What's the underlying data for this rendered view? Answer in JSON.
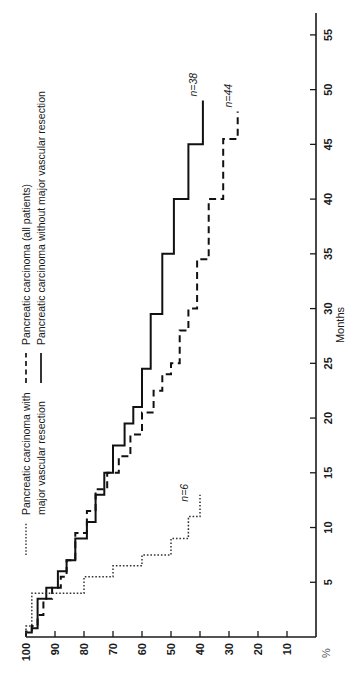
{
  "chart_data": {
    "type": "line",
    "title": "",
    "subtitle": "",
    "xlabel": "Months",
    "ylabel": "%",
    "xlim": [
      0,
      57
    ],
    "ylim": [
      0,
      100
    ],
    "xticks": [
      5,
      10,
      15,
      20,
      25,
      30,
      35,
      40,
      45,
      50,
      55
    ],
    "xticklabels": [
      "5",
      "10",
      "15",
      "20",
      "25",
      "30",
      "35",
      "40",
      "45",
      "50",
      "55"
    ],
    "yticks": [
      10,
      20,
      30,
      40,
      50,
      60,
      70,
      80,
      90,
      100
    ],
    "yticklabels": [
      "10",
      "20",
      "30",
      "40",
      "50",
      "60",
      "70",
      "80",
      "90",
      "100"
    ],
    "y_axis_unit_mark": "%",
    "grid": false,
    "orientation": "rotated-90-ccw",
    "legend_position": "top-left",
    "series": [
      {
        "name": "Pancreatic carcinoma (all patients)",
        "style": "dashed",
        "n_label": "n=44",
        "points": [
          [
            0,
            100
          ],
          [
            0.5,
            100
          ],
          [
            0.5,
            98
          ],
          [
            1.0,
            98
          ],
          [
            1.0,
            96
          ],
          [
            2.0,
            96
          ],
          [
            2.0,
            94
          ],
          [
            3.5,
            94
          ],
          [
            3.5,
            91
          ],
          [
            4.5,
            91
          ],
          [
            4.5,
            88
          ],
          [
            5.5,
            88
          ],
          [
            5.5,
            86
          ],
          [
            7.0,
            86
          ],
          [
            7.0,
            83
          ],
          [
            9.5,
            83
          ],
          [
            9.5,
            79
          ],
          [
            11.5,
            79
          ],
          [
            11.5,
            76
          ],
          [
            13.5,
            76
          ],
          [
            13.5,
            72
          ],
          [
            15.0,
            72
          ],
          [
            15.0,
            68
          ],
          [
            16.5,
            68
          ],
          [
            16.5,
            64
          ],
          [
            18.5,
            64
          ],
          [
            18.5,
            60
          ],
          [
            20.5,
            60
          ],
          [
            20.5,
            56
          ],
          [
            22.5,
            56
          ],
          [
            22.5,
            53
          ],
          [
            24.0,
            53
          ],
          [
            24.0,
            50
          ],
          [
            25.0,
            50
          ],
          [
            25.0,
            47
          ],
          [
            28.0,
            47
          ],
          [
            28.0,
            44
          ],
          [
            30.0,
            44
          ],
          [
            30.0,
            41
          ],
          [
            34.5,
            41
          ],
          [
            34.5,
            37
          ],
          [
            40.0,
            37
          ],
          [
            40.0,
            32
          ],
          [
            45.5,
            32
          ],
          [
            45.5,
            27
          ],
          [
            48.0,
            27
          ]
        ]
      },
      {
        "name": "Pancreatic carcinoma without major vascular resection",
        "style": "solid",
        "n_label": "n=38",
        "points": [
          [
            0,
            100
          ],
          [
            0.4,
            100
          ],
          [
            0.4,
            98
          ],
          [
            0.8,
            98
          ],
          [
            0.8,
            96
          ],
          [
            3.5,
            96
          ],
          [
            3.5,
            93
          ],
          [
            4.5,
            93
          ],
          [
            4.5,
            89
          ],
          [
            6.0,
            89
          ],
          [
            6.0,
            86
          ],
          [
            7.0,
            86
          ],
          [
            7.0,
            83
          ],
          [
            9.0,
            83
          ],
          [
            9.0,
            79
          ],
          [
            10.5,
            79
          ],
          [
            10.5,
            76
          ],
          [
            13.0,
            76
          ],
          [
            13.0,
            73
          ],
          [
            15.0,
            73
          ],
          [
            15.0,
            70
          ],
          [
            17.5,
            70
          ],
          [
            17.5,
            66
          ],
          [
            19.5,
            66
          ],
          [
            19.5,
            63
          ],
          [
            21.0,
            63
          ],
          [
            21.0,
            60
          ],
          [
            24.5,
            60
          ],
          [
            24.5,
            57
          ],
          [
            29.5,
            57
          ],
          [
            29.5,
            53
          ],
          [
            35.0,
            53
          ],
          [
            35.0,
            49
          ],
          [
            40.0,
            49
          ],
          [
            40.0,
            44
          ],
          [
            45.0,
            44
          ],
          [
            45.0,
            39
          ],
          [
            49.0,
            39
          ]
        ]
      },
      {
        "name": "Pancreatic carcinoma with major vascular resection",
        "style": "dotted",
        "n_label": "n=6",
        "points": [
          [
            0,
            100
          ],
          [
            1.0,
            100
          ],
          [
            1.0,
            98
          ],
          [
            4.0,
            98
          ],
          [
            4.0,
            80
          ],
          [
            5.5,
            80
          ],
          [
            5.5,
            70
          ],
          [
            6.5,
            70
          ],
          [
            6.5,
            60
          ],
          [
            7.5,
            60
          ],
          [
            7.5,
            50
          ],
          [
            9.0,
            50
          ],
          [
            9.0,
            44
          ],
          [
            11.0,
            44
          ],
          [
            11.0,
            40
          ],
          [
            13.0,
            40
          ]
        ]
      }
    ],
    "annotations": [
      {
        "text": "n=38",
        "series": "Pancreatic carcinoma without major vascular resection",
        "x": 49,
        "y": 39
      },
      {
        "text": "n=44",
        "series": "Pancreatic carcinoma (all patients)",
        "x": 48,
        "y": 27
      },
      {
        "text": "n=6",
        "series": "Pancreatic carcinoma with major vascular resection",
        "x": 12,
        "y": 42
      }
    ]
  },
  "legend": {
    "group_top": {
      "entries": [
        {
          "marker": "dashed-line-marker",
          "label": "Pancreatic carcinoma (all patients)"
        },
        {
          "marker": "solid-line-marker",
          "label": "Pancreatic carcinoma without major vascular resection"
        }
      ]
    },
    "group_lower": {
      "entries": [
        {
          "marker": "dotted-line-marker",
          "label": "Pancreatic carcinoma with major vascular resection"
        }
      ]
    }
  },
  "axes": {
    "y_unit": "%",
    "x_title": "Months"
  },
  "colors": {
    "ink": "#111111",
    "background": "#ffffff",
    "muted": "#555555"
  }
}
